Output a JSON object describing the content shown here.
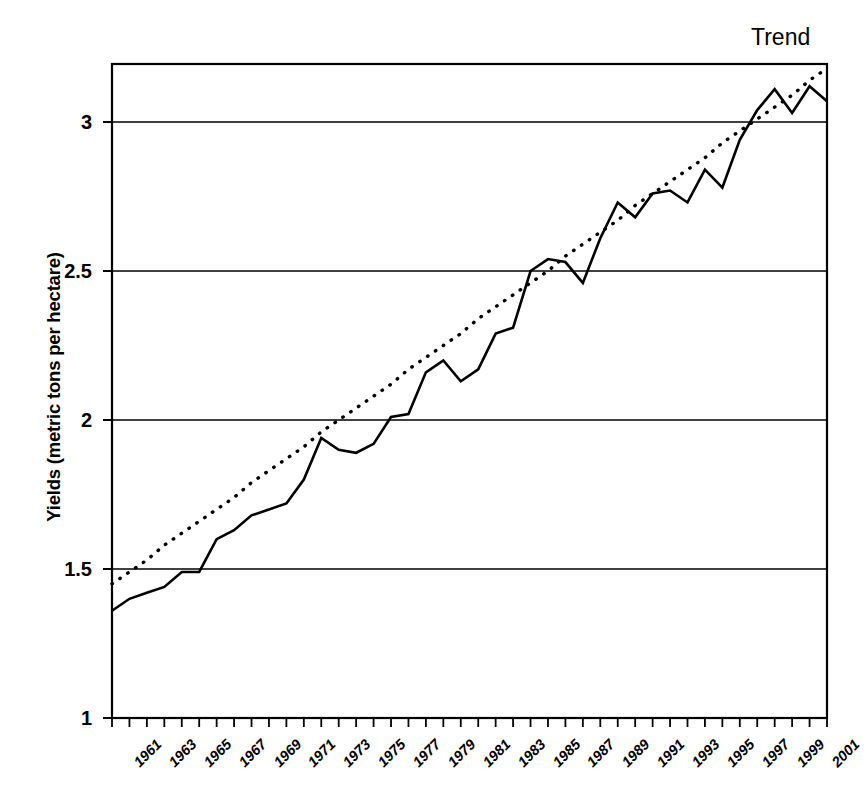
{
  "chart_data": {
    "type": "line",
    "title": "",
    "xlabel": "",
    "ylabel": "Yields (metric tons per hectare)",
    "ylim": [
      1,
      3.2
    ],
    "xlim": [
      1961,
      2002
    ],
    "grid": true,
    "legend_position": "top-right",
    "legend_entries": [
      "Trend"
    ],
    "y_ticks": [
      "1",
      "1.5",
      "2",
      "2.5",
      "3"
    ],
    "y_tick_values": [
      1,
      1.5,
      2,
      2.5,
      3
    ],
    "x_ticks": [
      "1961",
      "1963",
      "1965",
      "1967",
      "1969",
      "1971",
      "1973",
      "1975",
      "1977",
      "1979",
      "1981",
      "1983",
      "1985",
      "1987",
      "1989",
      "1991",
      "1993",
      "1995",
      "1997",
      "1999",
      "2001"
    ],
    "x": [
      1961,
      1962,
      1963,
      1964,
      1965,
      1966,
      1967,
      1968,
      1969,
      1970,
      1971,
      1972,
      1973,
      1974,
      1975,
      1976,
      1977,
      1978,
      1979,
      1980,
      1981,
      1982,
      1983,
      1984,
      1985,
      1986,
      1987,
      1988,
      1989,
      1990,
      1991,
      1992,
      1993,
      1994,
      1995,
      1996,
      1997,
      1998,
      1999,
      2000,
      2001,
      2002
    ],
    "series": [
      {
        "name": "Yields",
        "style": "solid",
        "values": [
          1.36,
          1.4,
          1.42,
          1.44,
          1.49,
          1.49,
          1.6,
          1.63,
          1.68,
          1.7,
          1.72,
          1.8,
          1.94,
          1.9,
          1.89,
          1.92,
          2.01,
          2.02,
          2.16,
          2.2,
          2.13,
          2.17,
          2.29,
          2.31,
          2.5,
          2.54,
          2.53,
          2.46,
          2.61,
          2.73,
          2.68,
          2.76,
          2.77,
          2.73,
          2.84,
          2.78,
          2.94,
          3.04,
          3.11,
          3.03,
          3.12,
          3.07
        ]
      },
      {
        "name": "Trend",
        "style": "dotted",
        "values": [
          1.45,
          1.49,
          1.53,
          1.58,
          1.62,
          1.66,
          1.7,
          1.74,
          1.79,
          1.83,
          1.87,
          1.91,
          1.96,
          2.0,
          2.04,
          2.08,
          2.12,
          2.17,
          2.21,
          2.25,
          2.29,
          2.34,
          2.38,
          2.42,
          2.46,
          2.5,
          2.55,
          2.59,
          2.63,
          2.67,
          2.72,
          2.76,
          2.8,
          2.84,
          2.88,
          2.93,
          2.97,
          3.01,
          3.05,
          3.09,
          3.14,
          3.18
        ]
      }
    ]
  },
  "legend": {
    "trend_label": "Trend"
  },
  "axes": {
    "y_title": "Yields (metric tons per hectare)"
  }
}
